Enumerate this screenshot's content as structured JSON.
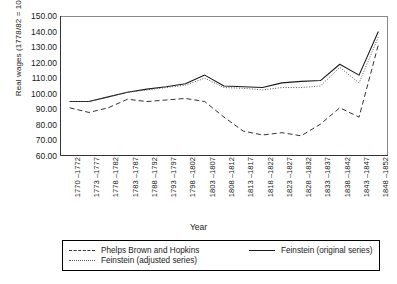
{
  "chart_data": {
    "type": "line",
    "title": "",
    "xlabel": "Year",
    "ylabel": "Real wages (1778/82 = 100)",
    "ylim": [
      60,
      150
    ],
    "ytick_step": 10,
    "grid": false,
    "legend_position": "bottom",
    "ytick_labels": [
      "150.00",
      "140.00",
      "130.00",
      "120.00",
      "110.00",
      "100.00",
      "90.00",
      "80.00",
      "70.00",
      "60.00"
    ],
    "categories": [
      "1770 –1772",
      "1773 –1777",
      "1778 –1782",
      "1783 –1787",
      "1788 –1792",
      "1793 –1797",
      "1798 –1802",
      "1803 –1807",
      "1808 –1812",
      "1813 –1817",
      "1818 –1822",
      "1823 –1827",
      "1828 –1832",
      "1833 –1837",
      "1838 –1842",
      "1843 –1847",
      "1848 –1852"
    ],
    "series": [
      {
        "name": "Phelps Brown and Hopkins",
        "style": "dashed",
        "color": "#333333",
        "values": [
          91,
          88,
          91,
          96.5,
          95,
          96,
          97,
          95,
          85,
          76,
          73.5,
          75,
          73,
          80.5,
          91,
          85,
          131.5
        ]
      },
      {
        "name": "Feinstein (original series)",
        "style": "solid",
        "color": "#1a1a1a",
        "values": [
          95,
          95,
          98,
          101,
          103,
          104.5,
          106.5,
          112,
          105,
          104.5,
          104,
          107,
          108,
          108.5,
          119,
          112,
          140
        ]
      },
      {
        "name": "Feinstein (adjusted series)",
        "style": "dotted",
        "color": "#555555",
        "values": [
          95,
          95,
          98,
          101,
          102.5,
          104,
          105.5,
          110,
          104,
          103.5,
          102.5,
          104,
          104,
          105,
          117,
          107,
          136.5
        ]
      }
    ]
  },
  "legend": {
    "items": [
      {
        "label": "Phelps Brown and Hopkins",
        "style": "dashed"
      },
      {
        "label": "Feinstein (original series)",
        "style": "solid"
      },
      {
        "label": "Feinstein (adjusted series)",
        "style": "dotted"
      }
    ]
  }
}
